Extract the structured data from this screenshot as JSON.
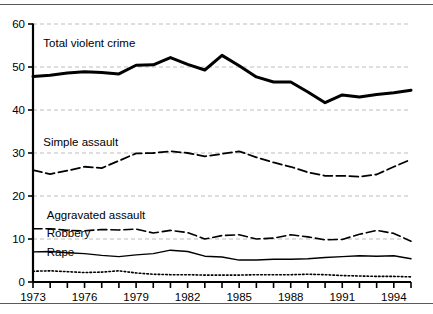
{
  "figure": {
    "name": "violent-crime-rates-line-chart",
    "rules": {
      "top": true,
      "bottom": true
    }
  },
  "chart_data": {
    "type": "line",
    "title": "",
    "subtitle": "",
    "xlabel": "",
    "ylabel": "",
    "xlim": [
      1973,
      1995
    ],
    "ylim": [
      0,
      60
    ],
    "ytick_values": [
      0,
      10,
      20,
      30,
      40,
      50,
      60
    ],
    "ytick_labels": [
      "0",
      "10",
      "20",
      "30",
      "40",
      "50",
      "60"
    ],
    "xtick_values": [
      1973,
      1974,
      1975,
      1976,
      1977,
      1978,
      1979,
      1980,
      1981,
      1982,
      1983,
      1984,
      1985,
      1986,
      1987,
      1988,
      1989,
      1990,
      1991,
      1992,
      1993,
      1994,
      1995
    ],
    "xtick_labels_shown": [
      "1973",
      "1976",
      "1979",
      "1982",
      "1985",
      "1988",
      "1991",
      "1994"
    ],
    "xtick_labels_shown_values": [
      1973,
      1976,
      1979,
      1982,
      1985,
      1988,
      1991,
      1994
    ],
    "grid": {
      "horizontal": true,
      "vertical": false,
      "style": "dashed",
      "color": "#bdbdbd"
    },
    "legend": {
      "position": "inline-annotations"
    },
    "x": [
      1973,
      1974,
      1975,
      1976,
      1977,
      1978,
      1979,
      1980,
      1981,
      1982,
      1983,
      1984,
      1985,
      1986,
      1987,
      1988,
      1989,
      1990,
      1991,
      1992,
      1993,
      1994,
      1995
    ],
    "series": [
      {
        "name": "Total violent crime",
        "label": "Total violent crime",
        "style": "solid-thick",
        "color": "#000000",
        "width": 3.0,
        "label_x": 1973.6,
        "label_y": 54.6,
        "values": [
          47.8,
          48.1,
          48.6,
          48.9,
          48.7,
          48.4,
          50.4,
          50.5,
          52.2,
          50.6,
          49.3,
          52.7,
          50.3,
          47.7,
          46.5,
          46.5,
          44.2,
          41.7,
          43.5,
          43.0,
          43.6,
          44.0,
          44.6
        ]
      },
      {
        "name": "Simple assault",
        "label": "Simple assault",
        "style": "dashed",
        "color": "#000000",
        "width": 1.8,
        "label_x": 1973.6,
        "label_y": 31.6,
        "values": [
          26.0,
          25.1,
          25.9,
          26.8,
          26.5,
          28.2,
          29.9,
          30.0,
          30.4,
          30.0,
          29.2,
          29.8,
          30.4,
          29.0,
          27.8,
          26.8,
          25.5,
          24.7,
          24.7,
          24.5,
          25.0,
          26.8,
          28.5
        ]
      },
      {
        "name": "Aggravated assault",
        "label": "Aggravated assault",
        "style": "dashed",
        "color": "#000000",
        "width": 1.6,
        "label_x": 1973.8,
        "label_y": 14.6,
        "values": [
          12.4,
          12.4,
          12.0,
          11.9,
          12.2,
          12.1,
          12.3,
          11.4,
          12.0,
          11.5,
          10.0,
          10.8,
          11.0,
          10.0,
          10.2,
          11.0,
          10.5,
          9.8,
          9.9,
          11.1,
          12.0,
          11.3,
          9.5
        ]
      },
      {
        "name": "Robbery",
        "label": "Robbery",
        "style": "solid-thin",
        "color": "#000000",
        "width": 1.4,
        "label_x": 1973.8,
        "label_y": 10.5,
        "values": [
          7.0,
          7.1,
          6.8,
          6.6,
          6.2,
          5.9,
          6.3,
          6.6,
          7.4,
          7.1,
          6.0,
          5.8,
          5.1,
          5.1,
          5.3,
          5.3,
          5.4,
          5.7,
          5.9,
          6.1,
          6.0,
          6.1,
          5.4
        ]
      },
      {
        "name": "Rape",
        "label": "Rape",
        "style": "dotted",
        "color": "#000000",
        "width": 1.6,
        "label_x": 1973.8,
        "label_y": 6.0,
        "values": [
          2.5,
          2.6,
          2.4,
          2.2,
          2.3,
          2.6,
          2.1,
          1.8,
          1.7,
          1.7,
          1.6,
          1.6,
          1.6,
          1.7,
          1.7,
          1.7,
          1.8,
          1.7,
          1.5,
          1.4,
          1.3,
          1.3,
          1.2
        ]
      }
    ]
  }
}
